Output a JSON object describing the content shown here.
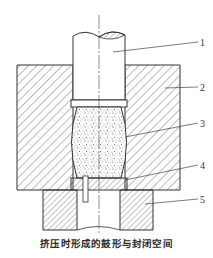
{
  "figure": {
    "caption": "挤压时形成的鼓形与封闭空间",
    "labels": [
      {
        "id": "1",
        "text": "1",
        "part": "punch"
      },
      {
        "id": "2",
        "text": "2",
        "part": "die"
      },
      {
        "id": "3",
        "text": "3",
        "part": "barrel-shaped-blank"
      },
      {
        "id": "4",
        "text": "4",
        "part": "bottom-ring"
      },
      {
        "id": "5",
        "text": "5",
        "part": "support"
      }
    ],
    "colors": {
      "line": "#333333",
      "hatch": "#555555",
      "background": "#ffffff"
    }
  }
}
